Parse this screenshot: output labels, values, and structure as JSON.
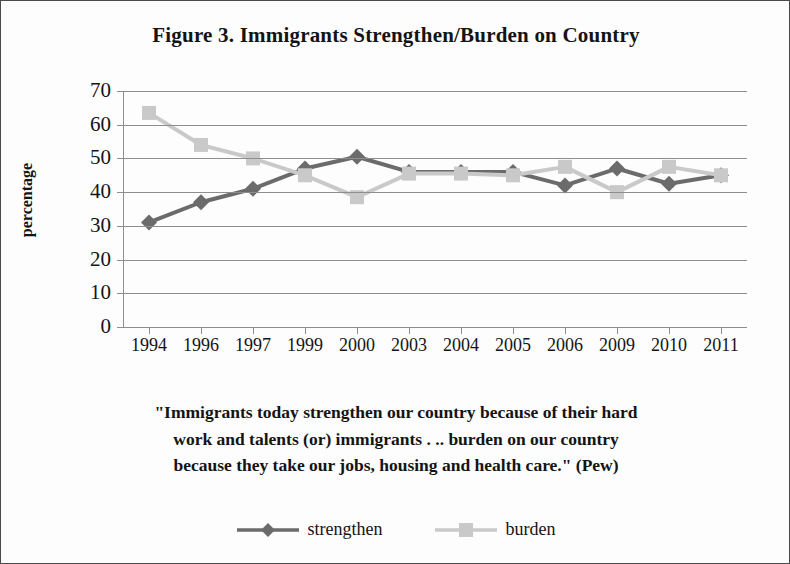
{
  "figure": {
    "title": "Figure 3. Immigrants Strengthen/Burden on Country",
    "caption_line1": "\"Immigrants today strengthen our country because of their hard",
    "caption_line2": "work and talents (or) immigrants . ..  burden on our country",
    "caption_line3": "because they take our jobs, housing and health care.\" (Pew)",
    "border_color": "#4a4a4a",
    "background": "#fdfdfd"
  },
  "legend": {
    "position": "bottom-center",
    "entries": [
      {
        "label": "strengthen",
        "marker": "diamond",
        "color": "#6b6b6b"
      },
      {
        "label": "burden",
        "marker": "square",
        "color": "#c9c9c9"
      }
    ]
  },
  "chart_data": {
    "type": "line",
    "title": "Figure 3. Immigrants Strengthen/Burden on Country",
    "xlabel": "",
    "ylabel": "percentage",
    "categories": [
      "1994",
      "1996",
      "1997",
      "1999",
      "2000",
      "2003",
      "2004",
      "2005",
      "2006",
      "2009",
      "2010",
      "2011"
    ],
    "yticks": [
      0,
      10,
      20,
      30,
      40,
      50,
      60,
      70
    ],
    "ylim": [
      0,
      70
    ],
    "grid": true,
    "legend_position": "bottom",
    "series": [
      {
        "name": "strengthen",
        "color": "#6b6b6b",
        "marker": "diamond",
        "values": [
          31,
          37,
          41,
          47,
          50.5,
          46,
          46,
          46,
          42,
          47,
          42.5,
          45
        ]
      },
      {
        "name": "burden",
        "color": "#c9c9c9",
        "marker": "square",
        "values": [
          63.5,
          54,
          50,
          45,
          38.5,
          45.5,
          45.5,
          45,
          47.5,
          40,
          47.5,
          45
        ]
      }
    ]
  }
}
